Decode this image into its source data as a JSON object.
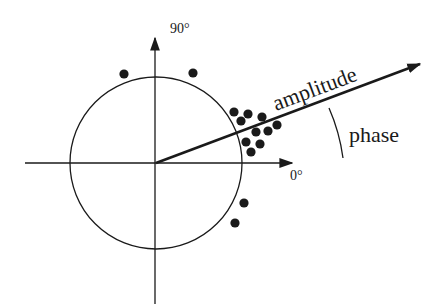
{
  "diagram": {
    "type": "polar-phasor",
    "labels": {
      "y_axis": "90°",
      "x_axis": "0°",
      "vector": "amplitude",
      "angle": "phase"
    },
    "colors": {
      "ink": "#1a1a1a",
      "background": "#ffffff"
    },
    "origin": [
      156,
      163
    ],
    "circle_radius": 86,
    "vector_tip": [
      421,
      64
    ],
    "points": [
      [
        124,
        74
      ],
      [
        193,
        73
      ],
      [
        234,
        112
      ],
      [
        248,
        114
      ],
      [
        241,
        121
      ],
      [
        262,
        117
      ],
      [
        277,
        125
      ],
      [
        256,
        132
      ],
      [
        268,
        131
      ],
      [
        246,
        142
      ],
      [
        260,
        144
      ],
      [
        251,
        152
      ],
      [
        244,
        203
      ],
      [
        235,
        223
      ]
    ]
  }
}
